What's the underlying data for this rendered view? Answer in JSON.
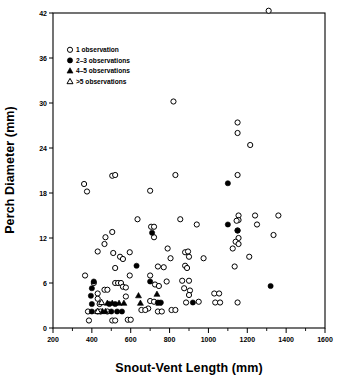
{
  "chart_data": {
    "type": "scatter",
    "title": "",
    "xlabel": "Snout-Vent Length (mm)",
    "ylabel": "Perch Diameter (mm)",
    "xlim": [
      200,
      1600
    ],
    "ylim": [
      0,
      42
    ],
    "xticks": [
      200,
      400,
      600,
      800,
      1000,
      1200,
      1400,
      1600
    ],
    "xticklabels": [
      "200",
      "400",
      "600",
      "800",
      "1000",
      "1200",
      "1400",
      "1600"
    ],
    "x_minor_tick_step": 100,
    "yticks": [
      0,
      6,
      12,
      18,
      24,
      30,
      36,
      42
    ],
    "yticklabels": [
      "0",
      "6",
      "12",
      "18",
      "24",
      "30",
      "36",
      "42"
    ],
    "grid": false,
    "legend_position": "upper-left-inside",
    "legend": [
      {
        "marker": "open-circle",
        "label": "1 observation"
      },
      {
        "marker": "filled-circle",
        "label": "2–3 observations"
      },
      {
        "marker": "filled-triangle",
        "label": "4–5 observations"
      },
      {
        "marker": "open-triangle",
        "label": ">5 observations"
      }
    ],
    "series": [
      {
        "name": "1 observation",
        "marker": "open-circle",
        "points": [
          [
            1310,
            42.3
          ],
          [
            820,
            30.2
          ],
          [
            1150,
            27.4
          ],
          [
            1150,
            26.0
          ],
          [
            1215,
            24.4
          ],
          [
            1150,
            20.4
          ],
          [
            830,
            20.4
          ],
          [
            505,
            20.3
          ],
          [
            520,
            20.4
          ],
          [
            360,
            19.2
          ],
          [
            375,
            18.2
          ],
          [
            700,
            18.3
          ],
          [
            1155,
            15.0
          ],
          [
            1155,
            14.4
          ],
          [
            1240,
            15.0
          ],
          [
            1360,
            15.0
          ],
          [
            1250,
            13.8
          ],
          [
            635,
            14.5
          ],
          [
            855,
            14.5
          ],
          [
            705,
            13.5
          ],
          [
            720,
            13.5
          ],
          [
            940,
            13.8
          ],
          [
            720,
            12.1
          ],
          [
            1155,
            12.0
          ],
          [
            1335,
            12.4
          ],
          [
            1140,
            11.5
          ],
          [
            1155,
            11.2
          ],
          [
            465,
            11.2
          ],
          [
            470,
            12.1
          ],
          [
            505,
            12.8
          ],
          [
            1125,
            10.6
          ],
          [
            430,
            10.2
          ],
          [
            510,
            10.0
          ],
          [
            545,
            9.5
          ],
          [
            595,
            10.1
          ],
          [
            790,
            10.6
          ],
          [
            880,
            10.1
          ],
          [
            895,
            10.2
          ],
          [
            900,
            9.5
          ],
          [
            1210,
            9.5
          ],
          [
            560,
            9.2
          ],
          [
            805,
            9.3
          ],
          [
            975,
            9.3
          ],
          [
            1135,
            8.2
          ],
          [
            520,
            8.0
          ],
          [
            740,
            8.2
          ],
          [
            770,
            8.1
          ],
          [
            880,
            8.3
          ],
          [
            890,
            8.0
          ],
          [
            365,
            7.0
          ],
          [
            595,
            7.0
          ],
          [
            700,
            7.0
          ],
          [
            785,
            6.2
          ],
          [
            865,
            6.3
          ],
          [
            900,
            6.3
          ],
          [
            410,
            6.0
          ],
          [
            520,
            6.0
          ],
          [
            535,
            6.0
          ],
          [
            550,
            6.0
          ],
          [
            725,
            5.8
          ],
          [
            745,
            5.6
          ],
          [
            560,
            5.5
          ],
          [
            575,
            5.4
          ],
          [
            465,
            5.1
          ],
          [
            480,
            5.1
          ],
          [
            875,
            5.3
          ],
          [
            905,
            5.0
          ],
          [
            1030,
            4.6
          ],
          [
            1055,
            4.6
          ],
          [
            430,
            4.6
          ],
          [
            900,
            4.4
          ],
          [
            575,
            4.2
          ],
          [
            430,
            3.9
          ],
          [
            700,
            3.6
          ],
          [
            720,
            3.5
          ],
          [
            1035,
            3.4
          ],
          [
            1060,
            3.4
          ],
          [
            1150,
            3.4
          ],
          [
            885,
            3.4
          ],
          [
            440,
            3.2
          ],
          [
            690,
            2.6
          ],
          [
            655,
            2.4
          ],
          [
            675,
            2.4
          ],
          [
            810,
            2.4
          ],
          [
            830,
            2.4
          ],
          [
            430,
            2.2
          ],
          [
            445,
            2.2
          ],
          [
            480,
            2.2
          ],
          [
            740,
            2.2
          ],
          [
            760,
            2.2
          ],
          [
            380,
            2.2
          ],
          [
            385,
            1.0
          ],
          [
            505,
            1.0
          ],
          [
            520,
            1.0
          ],
          [
            585,
            1.1
          ],
          [
            600,
            1.1
          ],
          [
            950,
            3.5
          ],
          [
            1145,
            14.3
          ],
          [
            1150,
            13.0
          ]
        ]
      },
      {
        "name": "2–3 observations",
        "marker": "filled-circle",
        "points": [
          [
            1100,
            19.3
          ],
          [
            1100,
            13.8
          ],
          [
            1150,
            13.0
          ],
          [
            710,
            12.7
          ],
          [
            630,
            8.3
          ],
          [
            410,
            6.2
          ],
          [
            400,
            5.3
          ],
          [
            700,
            6.2
          ],
          [
            1320,
            5.6
          ],
          [
            395,
            4.3
          ],
          [
            400,
            3.2
          ],
          [
            490,
            3.2
          ],
          [
            520,
            3.2
          ],
          [
            740,
            3.4
          ],
          [
            755,
            3.4
          ],
          [
            920,
            3.4
          ],
          [
            400,
            2.2
          ],
          [
            500,
            2.2
          ],
          [
            530,
            2.2
          ],
          [
            555,
            2.2
          ]
        ]
      },
      {
        "name": "4–5 observations",
        "marker": "filled-triangle",
        "points": [
          [
            480,
            3.3
          ],
          [
            505,
            3.3
          ],
          [
            540,
            3.3
          ],
          [
            565,
            3.3
          ],
          [
            640,
            4.3
          ],
          [
            650,
            3.3
          ],
          [
            735,
            4.5
          ],
          [
            745,
            3.3
          ],
          [
            455,
            2.2
          ],
          [
            470,
            2.2
          ]
        ]
      },
      {
        "name": ">5 observations",
        "marker": "open-triangle",
        "points": [
          [
            450,
            3.4
          ],
          [
            430,
            2.2
          ]
        ]
      }
    ]
  }
}
